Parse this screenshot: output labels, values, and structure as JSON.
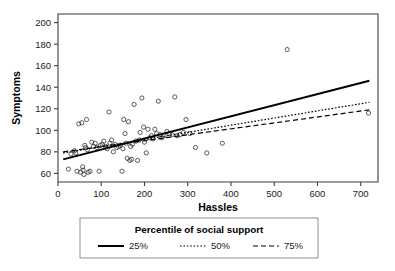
{
  "chart_data": {
    "type": "scatter",
    "title": "",
    "xlabel": "Hassles",
    "ylabel": "Symptoms",
    "xlim": [
      0,
      740
    ],
    "ylim": [
      52,
      208
    ],
    "xticks": [
      0,
      100,
      200,
      300,
      400,
      500,
      600,
      700
    ],
    "yticks": [
      60,
      80,
      100,
      120,
      140,
      160,
      180,
      200
    ],
    "grid": false,
    "legend_position": "below-plot",
    "legend_title": "Percentile of social support",
    "series": [
      {
        "name": "25%",
        "type": "line",
        "linestyle": "solid",
        "color": "#000000",
        "x": [
          12,
          720
        ],
        "y": [
          73,
          146
        ]
      },
      {
        "name": "50%",
        "type": "line",
        "linestyle": "dotted",
        "color": "#000000",
        "x": [
          12,
          720
        ],
        "y": [
          79,
          126
        ]
      },
      {
        "name": "75%",
        "type": "line",
        "linestyle": "dashed",
        "color": "#000000",
        "x": [
          12,
          720
        ],
        "y": [
          80,
          119
        ]
      },
      {
        "name": "observations",
        "type": "scatter",
        "marker": "open-circle",
        "color": "#2a2a2a",
        "points": [
          [
            24,
            64
          ],
          [
            30,
            78
          ],
          [
            38,
            81
          ],
          [
            41,
            79
          ],
          [
            44,
            62
          ],
          [
            48,
            106
          ],
          [
            52,
            61
          ],
          [
            55,
            107
          ],
          [
            57,
            66
          ],
          [
            58,
            63
          ],
          [
            60,
            59
          ],
          [
            62,
            86
          ],
          [
            64,
            84
          ],
          [
            66,
            110
          ],
          [
            68,
            82
          ],
          [
            70,
            61
          ],
          [
            74,
            62
          ],
          [
            78,
            89
          ],
          [
            82,
            85
          ],
          [
            86,
            88
          ],
          [
            90,
            84
          ],
          [
            95,
            62
          ],
          [
            98,
            86
          ],
          [
            102,
            87
          ],
          [
            106,
            90
          ],
          [
            110,
            85
          ],
          [
            114,
            83
          ],
          [
            118,
            117
          ],
          [
            120,
            88
          ],
          [
            124,
            91
          ],
          [
            128,
            80
          ],
          [
            132,
            87
          ],
          [
            136,
            84
          ],
          [
            140,
            85
          ],
          [
            144,
            86
          ],
          [
            148,
            62
          ],
          [
            150,
            83
          ],
          [
            152,
            110
          ],
          [
            155,
            97
          ],
          [
            158,
            88
          ],
          [
            160,
            74
          ],
          [
            163,
            108
          ],
          [
            166,
            72
          ],
          [
            168,
            85
          ],
          [
            170,
            73
          ],
          [
            172,
            87
          ],
          [
            176,
            124
          ],
          [
            180,
            90
          ],
          [
            184,
            72
          ],
          [
            188,
            91
          ],
          [
            190,
            98
          ],
          [
            194,
            130
          ],
          [
            198,
            103
          ],
          [
            200,
            89
          ],
          [
            204,
            79
          ],
          [
            208,
            101
          ],
          [
            212,
            93
          ],
          [
            216,
            95
          ],
          [
            220,
            92
          ],
          [
            224,
            101
          ],
          [
            228,
            97
          ],
          [
            232,
            127
          ],
          [
            236,
            96
          ],
          [
            240,
            93
          ],
          [
            246,
            95
          ],
          [
            252,
            99
          ],
          [
            258,
            97
          ],
          [
            264,
            96
          ],
          [
            270,
            131
          ],
          [
            276,
            95
          ],
          [
            282,
            96
          ],
          [
            290,
            98
          ],
          [
            296,
            110
          ],
          [
            305,
            97
          ],
          [
            318,
            84
          ],
          [
            344,
            79
          ],
          [
            380,
            88
          ],
          [
            530,
            175
          ],
          [
            718,
            116
          ]
        ]
      }
    ]
  },
  "legend": {
    "title": "Percentile of social support",
    "entries": [
      {
        "label": "25%",
        "style": "solid"
      },
      {
        "label": "50%",
        "style": "dotted"
      },
      {
        "label": "75%",
        "style": "dashed"
      }
    ]
  },
  "axes": {
    "x_title": "Hassles",
    "y_title": "Symptoms",
    "x_tick_labels": [
      "0",
      "100",
      "200",
      "300",
      "400",
      "500",
      "600",
      "700"
    ],
    "y_tick_labels": [
      "60",
      "80",
      "100",
      "120",
      "140",
      "160",
      "180",
      "200"
    ]
  }
}
